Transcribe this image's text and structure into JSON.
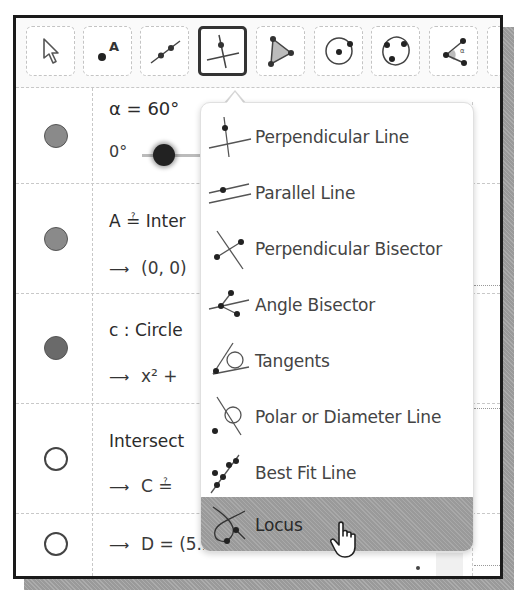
{
  "toolbar": {
    "tools": [
      {
        "name": "move",
        "icon": "arrow-pointer-icon"
      },
      {
        "name": "point",
        "icon": "point-icon",
        "label": "A"
      },
      {
        "name": "line",
        "icon": "line-through-points-icon"
      },
      {
        "name": "perpendicular-line",
        "icon": "perpendicular-line-icon",
        "active": true
      },
      {
        "name": "polygon",
        "icon": "polygon-icon"
      },
      {
        "name": "circle-center-point",
        "icon": "circle-center-point-icon"
      },
      {
        "name": "circle-three-points",
        "icon": "circle-three-points-icon"
      },
      {
        "name": "angle",
        "icon": "angle-icon"
      }
    ]
  },
  "algebra": {
    "rows": [
      {
        "marble": "on",
        "line1": "α = 60°",
        "slider": {
          "min": "0°",
          "max": "360°",
          "value": 60
        }
      },
      {
        "marble": "on",
        "line1": "A = Intersect (xAxis, yAxis)",
        "line1_visible": "A ≟ Inter",
        "line2": "(0, 0)"
      },
      {
        "marble": "on",
        "line1": "c : Circle (A, 5.25)",
        "line1_visible": "c : Circle",
        "line2": "x² + y² = 27.56",
        "line2_visible": "x² +"
      },
      {
        "marble": "off",
        "line1": "Intersect (c, xAxis)",
        "line1_visible": "Intersect",
        "line2": "C = (-5.25, 0)",
        "line2_visible": "C ≟"
      },
      {
        "marble": "off",
        "line2": "D = (5.25, 0)"
      }
    ],
    "background": {
      "slider_max": "360°",
      "intersect_args": "ect (xAxis, yAxis)",
      "circle_args": "(A, 5.25)",
      "circle_rhs": "27.56",
      "intersect2_args": "(c, xAxis)",
      "c_value": "(-5.25, 0)"
    }
  },
  "menu": {
    "items": [
      {
        "label": "Perpendicular Line",
        "icon": "perpendicular-line-icon"
      },
      {
        "label": "Parallel Line",
        "icon": "parallel-line-icon"
      },
      {
        "label": "Perpendicular Bisector",
        "icon": "perpendicular-bisector-icon"
      },
      {
        "label": "Angle Bisector",
        "icon": "angle-bisector-icon"
      },
      {
        "label": "Tangents",
        "icon": "tangents-icon"
      },
      {
        "label": "Polar or Diameter Line",
        "icon": "polar-diameter-line-icon"
      },
      {
        "label": "Best Fit Line",
        "icon": "best-fit-line-icon"
      },
      {
        "label": "Locus",
        "icon": "locus-icon",
        "highlighted": true
      }
    ]
  },
  "colors": {
    "frame": "#1a1a1a",
    "shadow": "#9a9a9a",
    "highlight": "#9a9a9a",
    "text": "#333333"
  }
}
